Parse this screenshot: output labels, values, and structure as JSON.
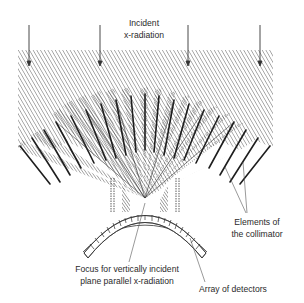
{
  "labels": {
    "incident_line1": "Incident",
    "incident_line2": "x-radiation",
    "collimator_line1": "Elements of",
    "collimator_line2": "the collimator",
    "focus_line1": "Focus for vertically incident",
    "focus_line2": "plane parallel x-radiation",
    "detectors": "Array of detectors"
  },
  "arrows": {
    "count": 4,
    "x_positions": [
      29,
      100,
      188,
      260
    ],
    "direction": "down"
  },
  "collimator": {
    "element_count": 19,
    "focus_point": [
      145,
      198
    ]
  },
  "detector_array": {
    "shape": "arc",
    "segment_count": 22
  },
  "colors": {
    "line": "#222222",
    "hatch": "#555555",
    "label": "#2a2a2a",
    "background": "#ffffff"
  }
}
